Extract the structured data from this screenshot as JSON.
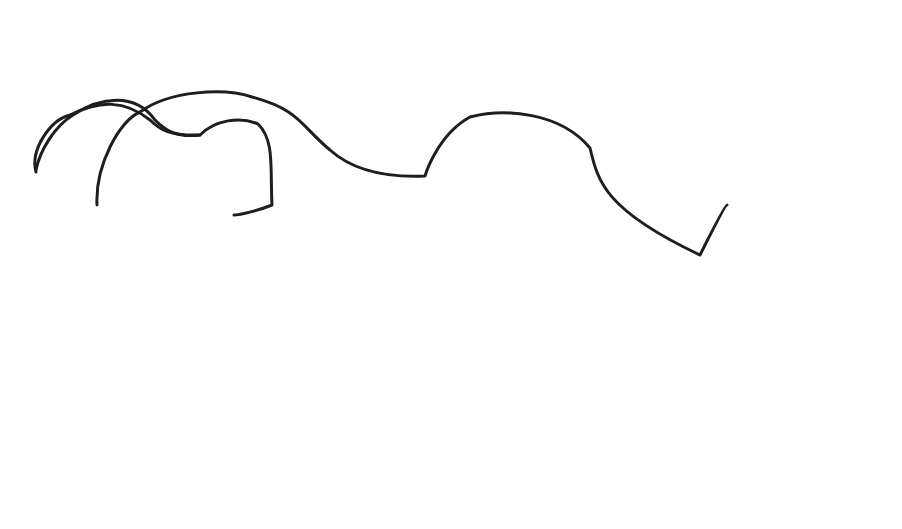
{
  "figure": {
    "panels": [
      {
        "letter": "A",
        "labels": []
      },
      {
        "letter": "B",
        "labels": [
          {
            "id": "greater-trochanter",
            "lines": [
              "Greater",
              "trochanter"
            ]
          },
          {
            "id": "trochantocapital-ridge",
            "lines": [
              "Trochantocapital",
              "ridge"
            ]
          },
          {
            "id": "vastus-ridge",
            "lines": [
              "Vastus",
              "ridge"
            ]
          },
          {
            "id": "lesser-trochanter-b",
            "lines": [
              "Lesser",
              "trochanter"
            ]
          }
        ]
      },
      {
        "letter": "C",
        "labels": [
          {
            "id": "cervical-tubercle",
            "lines": [
              "Cervical",
              "tubercle"
            ]
          },
          {
            "id": "third-trochanter",
            "lines": [
              "Third",
              "trochanter"
            ]
          }
        ]
      },
      {
        "letter": "D",
        "labels": [
          {
            "id": "trochanteric-fossa",
            "lines": [
              "Trochanteric",
              "fossa"
            ]
          },
          {
            "id": "intertrochanteric-crest",
            "lines": [
              "Intertrochanteric",
              "crest"
            ]
          },
          {
            "id": "lesser-trochanter-d",
            "lines": [
              "Lesser trochanter"
            ]
          },
          {
            "id": "linea-aspera",
            "lines": [
              "Linea aspera"
            ]
          }
        ]
      }
    ]
  }
}
